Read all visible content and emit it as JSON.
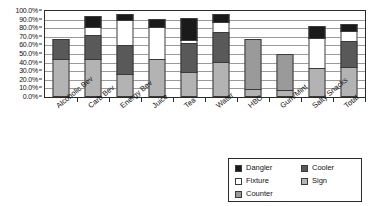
{
  "chart_data": {
    "type": "bar",
    "subtype": "stacked-bar",
    "title": "",
    "xlabel": "",
    "ylabel": "",
    "ylim": [
      0,
      100
    ],
    "ytick_labels": [
      "0.0%",
      "10.0%",
      "20.0%",
      "30.0%",
      "40.0%",
      "50.0%",
      "60.0%",
      "70.0%",
      "80.0%",
      "90.0%",
      "100.0%"
    ],
    "ytick_values": [
      0,
      10,
      20,
      30,
      40,
      50,
      60,
      70,
      80,
      90,
      100
    ],
    "grid": true,
    "legend_position": "bottom-right",
    "categories": [
      "Alcoholic Bev",
      "Carb Bev",
      "Energy Bev",
      "Juice",
      "Tea",
      "Water",
      "HBC",
      "Gum/Mint",
      "Salty Snacks",
      "Total"
    ],
    "stack_order_bottom_to_top": [
      "Sign",
      "Counter",
      "Cooler",
      "Fixture",
      "Dangler"
    ],
    "series": [
      {
        "name": "Sign",
        "color": "#b3b3b3",
        "values": [
          43,
          43,
          26,
          43,
          28,
          39,
          8,
          7,
          32,
          34
        ]
      },
      {
        "name": "Counter",
        "color": "#9a9a9a",
        "values": [
          0,
          0,
          0,
          0,
          0,
          0,
          58,
          42,
          0,
          0
        ]
      },
      {
        "name": "Cooler",
        "color": "#595959",
        "values": [
          23,
          28,
          33,
          0,
          34,
          36,
          0,
          0,
          0,
          30
        ]
      },
      {
        "name": "Fixture",
        "color": "#ffffff",
        "values": [
          0,
          9,
          29,
          37,
          3,
          11,
          0,
          0,
          36,
          12
        ]
      },
      {
        "name": "Dangler",
        "color": "#1a1a1a",
        "values": [
          0,
          13,
          7,
          10,
          26,
          9,
          0,
          0,
          14,
          8
        ]
      }
    ],
    "totals": [
      66,
      93,
      95,
      90,
      91,
      95,
      66,
      49,
      82,
      84
    ]
  },
  "legend": {
    "items": [
      {
        "label": "Dangler",
        "color": "#1a1a1a",
        "column": "left"
      },
      {
        "label": "Fixture",
        "color": "#ffffff",
        "column": "left"
      },
      {
        "label": "Counter",
        "color": "#9a9a9a",
        "column": "left"
      },
      {
        "label": "Cooler",
        "color": "#595959",
        "column": "right"
      },
      {
        "label": "Sign",
        "color": "#b3b3b3",
        "column": "right"
      }
    ]
  },
  "colors": {
    "axis": "#2b2b2b",
    "gridline": "#9a9a9a",
    "background": "#ffffff",
    "text": "#141414"
  }
}
